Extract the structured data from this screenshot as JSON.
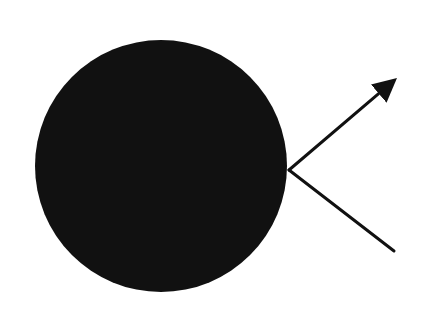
{
  "diagram": {
    "background": "#ffffff",
    "ink_color": "#111111",
    "circle": {
      "cx": 161,
      "cy": 166,
      "r": 126,
      "fill": "#111111"
    },
    "vertex": {
      "x": 289,
      "y": 170
    },
    "arrow_line": {
      "from": {
        "x": 289,
        "y": 170
      },
      "to": {
        "x": 397,
        "y": 78
      },
      "head": "filled-triangle",
      "stroke_width": 3
    },
    "plain_line": {
      "from": {
        "x": 289,
        "y": 170
      },
      "to": {
        "x": 394,
        "y": 251
      },
      "head": "none",
      "stroke_width": 3
    }
  }
}
